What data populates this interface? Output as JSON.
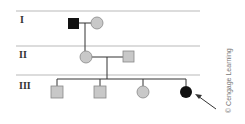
{
  "diagram": {
    "type": "pedigree",
    "generations": [
      {
        "label": "I"
      },
      {
        "label": "II"
      },
      {
        "label": "III"
      }
    ],
    "individuals": [
      {
        "id": "I-1",
        "sex": "male",
        "affected": true
      },
      {
        "id": "I-2",
        "sex": "female",
        "affected": false
      },
      {
        "id": "II-1",
        "sex": "female",
        "affected": false
      },
      {
        "id": "II-2",
        "sex": "male",
        "affected": false
      },
      {
        "id": "III-1",
        "sex": "male",
        "affected": false
      },
      {
        "id": "III-2",
        "sex": "male",
        "affected": false
      },
      {
        "id": "III-3",
        "sex": "female",
        "affected": false
      },
      {
        "id": "III-4",
        "sex": "female",
        "affected": true,
        "proband": true
      }
    ],
    "colors": {
      "affected": "#111111",
      "unaffected": "#c8c8c8",
      "line": "#333333",
      "divider": "#d0d0d0"
    },
    "credit": "© Cengage Learning"
  }
}
